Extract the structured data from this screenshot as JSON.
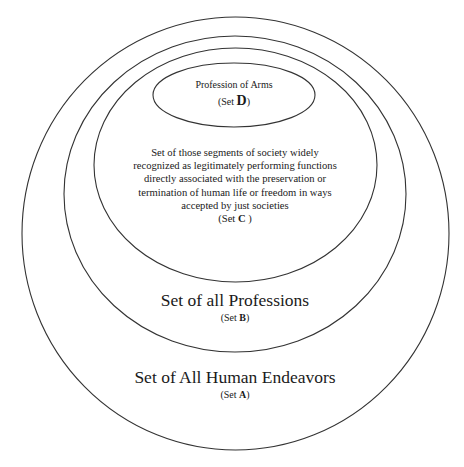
{
  "diagram": {
    "type": "nested-sets (Euler diagram)",
    "stroke_color": "#333333",
    "background": "#ffffff",
    "sets": [
      {
        "id": "A",
        "title": "Set of All Human Endeavors",
        "set_prefix": "(Set ",
        "set_letter": "A",
        "set_suffix": ")",
        "ellipse": {
          "cx": 235.5,
          "cy": 233.5,
          "rx": 213.5,
          "ry": 216.5
        }
      },
      {
        "id": "B",
        "title": "Set of all Professions",
        "set_prefix": "(Set ",
        "set_letter": "B",
        "set_suffix": ")",
        "ellipse": {
          "cx": 235,
          "cy": 194,
          "rx": 171,
          "ry": 158
        }
      },
      {
        "id": "C",
        "title": "Set of those segments of society widely recognized as legitimately performing functions directly associated with the preservation or termination of human life or freedom in ways accepted by just societies",
        "title_lines": [
          "Set of those segments of society widely",
          "recognized as legitimately performing functions",
          "directly associated with the preservation or",
          "termination of human life or freedom in ways",
          "accepted by just societies"
        ],
        "set_prefix": "(Set ",
        "set_letter": "C",
        "set_suffix": " )",
        "ellipse": {
          "cx": 235.5,
          "cy": 165,
          "rx": 141.5,
          "ry": 117
        }
      },
      {
        "id": "D",
        "title": "Profession of Arms",
        "set_prefix": "(Set ",
        "set_letter": "D",
        "set_suffix": ")",
        "ellipse": {
          "cx": 234,
          "cy": 95,
          "rx": 81,
          "ry": 32
        }
      }
    ],
    "relations": [
      "D ⊂ C",
      "C ⊂ B",
      "B ⊂ A"
    ]
  }
}
